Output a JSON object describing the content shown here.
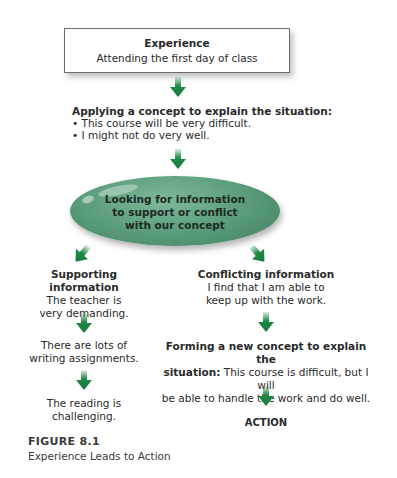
{
  "experience_box": {
    "title": "Experience",
    "text": "Attending the first day of class"
  },
  "applying_concept": {
    "heading": "Applying a concept to explain the situation:",
    "bullets": [
      "• This course will be very difficult.",
      "• I might not do very well."
    ]
  },
  "central_node": {
    "lines": [
      "Looking for information",
      "to support or conflict",
      "with our concept"
    ]
  },
  "supporting": {
    "heading": "Supporting information",
    "items": [
      [
        "The teacher is",
        "very demanding."
      ],
      [
        "There are lots of",
        "writing assignments."
      ],
      [
        "The reading is",
        "challenging."
      ]
    ]
  },
  "conflicting": {
    "heading": "Conflicting information",
    "lines": [
      "I find that I am able to",
      "keep up with the work."
    ]
  },
  "new_concept": {
    "heading": "Forming a new concept to explain the",
    "heading_2": "situation:",
    "text_1": " This course is difficult, but I will",
    "text_2": "be able to handle the work and do well."
  },
  "action": {
    "label": "ACTION"
  },
  "figure": {
    "number": "FIGURE 8.1",
    "title": "Experience Leads to Action"
  },
  "copyright": "Copyright © Cengage Learning",
  "colors": {
    "arrow_green": "#1f8a45",
    "ellipse_green": "#5e9f80",
    "box_border": "#6d6d6d"
  }
}
